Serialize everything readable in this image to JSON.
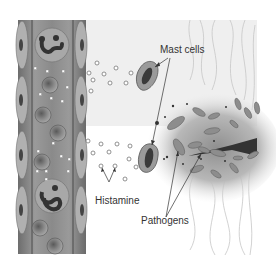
{
  "diagram": {
    "labels": {
      "mast_cells": "Mast cells",
      "histamine": "Histamine",
      "pathogens": "Pathogens"
    },
    "colors": {
      "vessel_dark": "#5a5a5a",
      "vessel_mid": "#8a8a8a",
      "vessel_light": "#b5b5b5",
      "tissue_bg": "#eeeeee",
      "wound_shadow": "#9c9c9c",
      "pathogen": "#8d8d8d",
      "fiber": "#c8c8c8",
      "text": "#333333"
    }
  }
}
